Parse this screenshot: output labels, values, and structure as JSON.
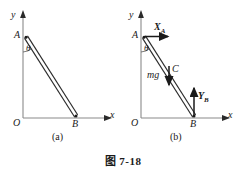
{
  "figure": {
    "caption": "图 7-18",
    "background_color": "#ffffff",
    "ink_color": "#1a1a1a",
    "axis_color": "#8a8a8a"
  },
  "panels": [
    {
      "id": "a",
      "sublabel": "(a)",
      "axis": {
        "y_label": "y",
        "x_label": "x",
        "origin_label": "O"
      },
      "points": {
        "A": "A",
        "B": "B"
      },
      "angles": {
        "theta": "θ"
      },
      "forces": []
    },
    {
      "id": "b",
      "sublabel": "(b)",
      "axis": {
        "y_label": "y",
        "x_label": "x",
        "origin_label": "O"
      },
      "points": {
        "A": "A",
        "B": "B",
        "C": "C"
      },
      "angles": {
        "theta": "θ"
      },
      "forces": [
        {
          "name": "X_A",
          "symbol": "X",
          "subscript": "A",
          "direction": "right",
          "applied_at": "A"
        },
        {
          "name": "mg",
          "symbol": "mg",
          "subscript": "",
          "direction": "down",
          "applied_at": "C"
        },
        {
          "name": "Y_B",
          "symbol": "Y",
          "subscript": "B",
          "direction": "up",
          "applied_at": "B"
        }
      ]
    }
  ]
}
